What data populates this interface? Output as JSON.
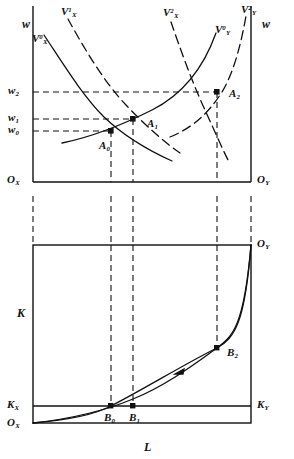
{
  "figure": {
    "type": "economics-diagram"
  },
  "upper_panel": {
    "name": "factor-market-panel",
    "axis_labels": {
      "left_vertical": "w",
      "right_vertical": "w",
      "origin_left": "O",
      "origin_left_sub": "X",
      "origin_right": "O",
      "origin_right_sub": "Y"
    },
    "wage_ticks": [
      {
        "id": "w2",
        "label": "w",
        "sub": "2",
        "value": 0.72
      },
      {
        "id": "w1",
        "label": "w",
        "sub": "1",
        "value": 0.46
      },
      {
        "id": "w0",
        "label": "w",
        "sub": "0",
        "value": 0.37
      }
    ],
    "curves": [
      {
        "id": "VX0",
        "label": "V",
        "sup": "0",
        "sub": "X",
        "style": "solid",
        "sector": "X",
        "shift": 0
      },
      {
        "id": "VX1",
        "label": "V",
        "sup": "1",
        "sub": "X",
        "style": "dashed",
        "sector": "X",
        "shift": 1
      },
      {
        "id": "VX2",
        "label": "V",
        "sup": "2",
        "sub": "X",
        "style": "dashed",
        "sector": "X",
        "shift": 2
      },
      {
        "id": "VY0",
        "label": "V",
        "sup": "0",
        "sub": "Y",
        "style": "solid",
        "sector": "Y",
        "shift": 0
      },
      {
        "id": "VY2",
        "label": "V",
        "sup": "2",
        "sub": "Y",
        "style": "dashed",
        "sector": "Y",
        "shift": 2
      }
    ],
    "equilibria": [
      {
        "id": "A0",
        "label": "A",
        "sub": "0",
        "x": 111,
        "y": 131
      },
      {
        "id": "A1",
        "label": "A",
        "sub": "1",
        "x": 133,
        "y": 119
      },
      {
        "id": "A2",
        "label": "A",
        "sub": "2",
        "x": 217,
        "y": 92
      }
    ]
  },
  "lower_panel": {
    "name": "edgeworth-box-panel",
    "axis_labels": {
      "vertical_K": "K",
      "horizontal_L": "L",
      "origin_bottom_left": "O",
      "origin_bottom_left_sub": "X",
      "origin_top_right": "O",
      "origin_top_right_sub": "Y",
      "capital_left": "K",
      "capital_left_sub": "X",
      "capital_right": "K",
      "capital_right_sub": "Y"
    },
    "points": [
      {
        "id": "B0",
        "label": "B",
        "sub": "0",
        "x": 111,
        "y": 406
      },
      {
        "id": "B1",
        "label": "B",
        "sub": "1",
        "x": 133,
        "y": 406
      },
      {
        "id": "B2",
        "label": "B",
        "sub": "2",
        "x": 217,
        "y": 348
      }
    ],
    "curves": [
      {
        "id": "contract-curve-outer",
        "style": "solid"
      },
      {
        "id": "contract-curve-inner",
        "style": "solid",
        "has_arrow": true
      }
    ]
  },
  "colors": {
    "line": "#111111",
    "background": "#ffffff"
  }
}
